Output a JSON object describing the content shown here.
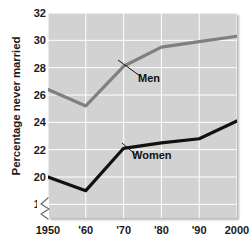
{
  "chart_data": {
    "type": "line",
    "title": "",
    "xlabel": "",
    "ylabel": "Percentage never married",
    "x": [
      1950,
      1960,
      1970,
      1980,
      1990,
      2000
    ],
    "categories": [
      "1950",
      "'60",
      "'70",
      "'80",
      "'90",
      "2000"
    ],
    "series": [
      {
        "name": "Men",
        "color": "#808080",
        "values": [
          26.4,
          25.2,
          28.1,
          29.5,
          29.9,
          30.3
        ]
      },
      {
        "name": "Women",
        "color": "#111111",
        "values": [
          20.0,
          19.0,
          22.1,
          22.5,
          22.8,
          24.1
        ]
      }
    ],
    "ylim": [
      17.0,
      32.0
    ],
    "yticks": [
      18,
      20,
      22,
      24,
      26,
      28,
      30,
      32
    ],
    "ytick_labels": [
      "18",
      "20",
      "22",
      "24",
      "26",
      "28",
      "30",
      "32"
    ],
    "xlim": [
      1950,
      2000
    ],
    "grid": true,
    "legend_position": "inline-annotations",
    "axis_break": "y-axis broken below 18",
    "annotations": [
      {
        "text": "Men",
        "x_px": 138,
        "y_px": 72
      },
      {
        "text": "Women",
        "x_px": 132,
        "y_px": 149
      }
    ],
    "plot_background": "#d2d2d2",
    "gridline_color": "#ffffff"
  }
}
